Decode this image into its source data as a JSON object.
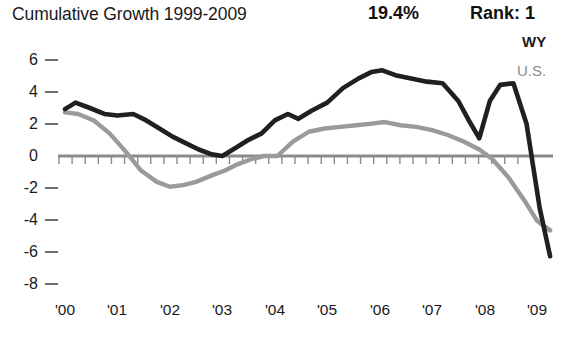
{
  "header": {
    "title": "Cumulative Growth 1999-2009",
    "percent": "19.4%",
    "rank": "Rank: 1"
  },
  "legend": {
    "position": "top-right",
    "entries": [
      {
        "label": "WY",
        "color": "#211f1f"
      },
      {
        "label": "U.S.",
        "color": "#9a9a9a"
      }
    ]
  },
  "chart_data": {
    "type": "line",
    "title": "Cumulative Growth 1999-2009",
    "xlabel": "",
    "ylabel": "",
    "ylim": [
      -8,
      6
    ],
    "xlim": [
      "'00",
      "'09"
    ],
    "grid": false,
    "legend_position": "top-right",
    "annotations": [
      {
        "text": "19.4%",
        "role": "cumulative-growth-value"
      },
      {
        "text": "Rank: 1",
        "role": "state-rank"
      }
    ],
    "yticks": [
      6,
      4,
      2,
      0,
      -2,
      -4,
      -6,
      -8
    ],
    "ytick_labels": [
      "6",
      "4",
      "2",
      "0",
      "-2",
      "-4",
      "-6",
      "-8"
    ],
    "xticks": [
      "'00",
      "'01",
      "'02",
      "'03",
      "'04",
      "'05",
      "'06",
      "'07",
      "'08",
      "'09"
    ],
    "xtick_labels": [
      "'00",
      "'01",
      "'02",
      "'03",
      "'04",
      "'05",
      "'06",
      "'07",
      "'08",
      "'09"
    ],
    "minor_ticks_per_year": 4,
    "series": [
      {
        "name": "WY",
        "color": "#211f1f",
        "x": [
          "'00.00",
          "'00.20",
          "'00.45",
          "'00.75",
          "'01.00",
          "'01.30",
          "'01.55",
          "'01.80",
          "'02.05",
          "'02.30",
          "'02.55",
          "'02.80",
          "'03.00",
          "'03.25",
          "'03.50",
          "'03.75",
          "'04.00",
          "'04.25",
          "'04.45",
          "'04.70",
          "'05.00",
          "'05.30",
          "'05.60",
          "'05.85",
          "'06.05",
          "'06.30",
          "'06.60",
          "'06.90",
          "'07.20",
          "'07.50",
          "'07.70",
          "'07.90",
          "'08.10",
          "'08.30",
          "'08.55",
          "'08.80",
          "'09.05",
          "'09.25"
        ],
        "values": [
          2.9,
          3.3,
          3.0,
          2.6,
          2.5,
          2.6,
          2.2,
          1.7,
          1.2,
          0.8,
          0.4,
          0.1,
          0.0,
          0.5,
          1.0,
          1.4,
          2.2,
          2.6,
          2.3,
          2.8,
          3.3,
          4.2,
          4.8,
          5.2,
          5.3,
          5.0,
          4.8,
          4.6,
          4.5,
          3.4,
          2.2,
          1.1,
          3.4,
          4.4,
          4.5,
          2.0,
          -3.2,
          -6.2
        ]
      },
      {
        "name": "U.S.",
        "color": "#9a9a9a",
        "x": [
          "'00.00",
          "'00.25",
          "'00.55",
          "'00.85",
          "'01.15",
          "'01.45",
          "'01.75",
          "'02.00",
          "'02.25",
          "'02.50",
          "'02.80",
          "'03.05",
          "'03.30",
          "'03.55",
          "'03.80",
          "'04.05",
          "'04.35",
          "'04.65",
          "'04.95",
          "'05.25",
          "'05.55",
          "'05.85",
          "'06.10",
          "'06.40",
          "'06.70",
          "'07.00",
          "'07.30",
          "'07.60",
          "'07.90",
          "'08.15",
          "'08.45",
          "'08.75",
          "'09.00",
          "'09.25"
        ],
        "values": [
          2.7,
          2.6,
          2.2,
          1.4,
          0.3,
          -0.9,
          -1.6,
          -1.9,
          -1.8,
          -1.6,
          -1.2,
          -0.9,
          -0.5,
          -0.2,
          0.0,
          0.0,
          0.9,
          1.5,
          1.7,
          1.8,
          1.9,
          2.0,
          2.1,
          1.9,
          1.8,
          1.6,
          1.3,
          0.9,
          0.4,
          -0.2,
          -1.3,
          -2.7,
          -4.0,
          -4.6
        ]
      }
    ]
  }
}
